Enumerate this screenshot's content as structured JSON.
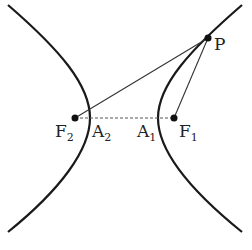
{
  "diagram": {
    "type": "hyperbola-foci",
    "colors": {
      "curve": "#1a1a1a",
      "line": "#333333",
      "dashed": "#555555",
      "text": "#222222"
    },
    "points": {
      "P": {
        "label": "P",
        "sub": "",
        "x": 208,
        "y": 38
      },
      "F1": {
        "label": "F",
        "sub": "1",
        "x": 174,
        "y": 118
      },
      "F2": {
        "label": "F",
        "sub": "2",
        "x": 75,
        "y": 118
      },
      "A1": {
        "label": "A",
        "sub": "1",
        "x": 158,
        "y": 118
      },
      "A2": {
        "label": "A",
        "sub": "2",
        "x": 90,
        "y": 118
      }
    },
    "segments": [
      {
        "from": "P",
        "to": "F2",
        "style": "solid"
      },
      {
        "from": "P",
        "to": "F1",
        "style": "solid"
      },
      {
        "from": "F2",
        "to": "F1",
        "style": "dashed"
      }
    ]
  }
}
